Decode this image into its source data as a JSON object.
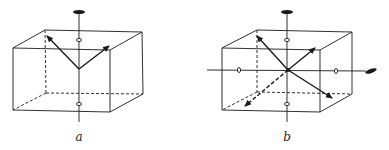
{
  "diagram": {
    "ink_color": "#1a1a1a",
    "background": "#ffffff",
    "panels": [
      {
        "label": "a",
        "cube": {
          "front": [
            [
              13,
              48
            ],
            [
              110,
              50
            ],
            [
              110,
              112
            ],
            [
              13,
              110
            ]
          ],
          "back_top": [
            [
              45,
              30
            ],
            [
              142,
              32
            ]
          ],
          "back_bottom_right": [
            143,
            94
          ],
          "back_bottom_left": [
            46,
            93
          ]
        },
        "vertical_axis": {
          "x": 79,
          "y1": 14,
          "y2": 122,
          "lens_top": [
            79,
            12
          ],
          "ovals": [
            [
              79,
              40
            ],
            [
              79,
              104
            ]
          ]
        },
        "center": [
          79,
          69
        ],
        "arrows": [
          [
            46,
            35
          ],
          [
            110,
            46
          ]
        ]
      },
      {
        "label": "b",
        "cube": {
          "front": [
            [
              222,
              48
            ],
            [
              320,
              50
            ],
            [
              320,
              112
            ],
            [
              222,
              110
            ]
          ],
          "back_top": [
            [
              257,
              30
            ],
            [
              352,
              32
            ]
          ],
          "back_bottom_right": [
            352,
            94
          ],
          "back_bottom_left": [
            257,
            92
          ]
        },
        "vertical_axis": {
          "x": 287,
          "y1": 14,
          "y2": 122,
          "lens_top": [
            287,
            12
          ],
          "ovals": [
            [
              287,
              40
            ],
            [
              287,
              104
            ]
          ]
        },
        "horizontal_axis": {
          "y": 70,
          "x1": 207,
          "x2": 366,
          "lens_end": [
            371,
            71
          ],
          "ovals": [
            [
              239,
              70
            ],
            [
              336,
              71
            ]
          ]
        },
        "center": [
          288,
          70
        ],
        "arrows": [
          [
            256,
            35
          ],
          [
            316,
            47
          ],
          [
            244,
            107
          ],
          [
            333,
            98
          ]
        ]
      }
    ]
  }
}
